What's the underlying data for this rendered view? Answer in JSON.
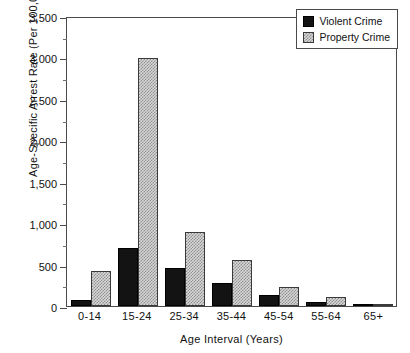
{
  "chart_data": {
    "type": "bar",
    "title": "",
    "xlabel": "Age Interval  (Years)",
    "ylabel": "Age-Specific Arrest Rate  (Per 100,000)",
    "categories": [
      "0-14",
      "15-24",
      "25-34",
      "35-44",
      "45-54",
      "55-64",
      "65+"
    ],
    "series": [
      {
        "name": "Violent Crime",
        "color": "#131313",
        "fill": "solid-black",
        "values": [
          70,
          700,
          460,
          280,
          130,
          45,
          12
        ]
      },
      {
        "name": "Property Crime",
        "color": "#c9c9c9",
        "fill": "checkered-gray",
        "values": [
          420,
          2990,
          890,
          560,
          230,
          105,
          30
        ]
      }
    ],
    "ylim": [
      0,
      3500
    ],
    "ytick_values": [
      0,
      500,
      1000,
      1500,
      2000,
      2500,
      3000,
      3500
    ],
    "ytick_labels": [
      "0",
      "500",
      "1,000",
      "1,500",
      "2,000",
      "2,500",
      "3,000",
      "3,500"
    ],
    "yminor_step": 250,
    "grid": false,
    "legend_position": "top-right"
  },
  "legend": {
    "entries": [
      {
        "label": "Violent Crime",
        "swatch": "violent"
      },
      {
        "label": "Property Crime",
        "swatch": "property"
      }
    ]
  }
}
